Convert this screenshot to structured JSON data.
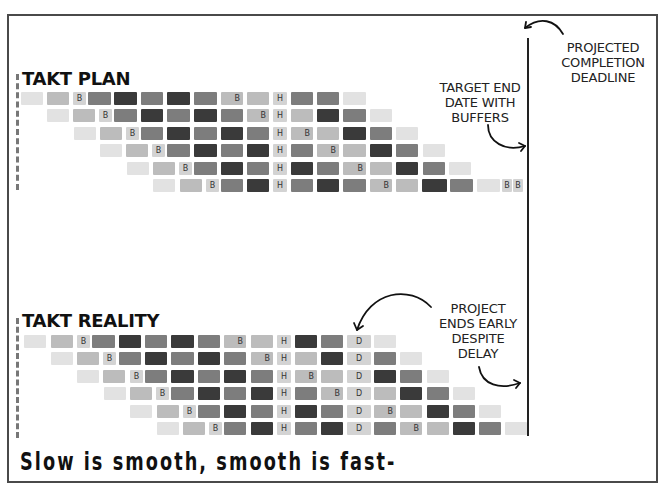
{
  "plan": {
    "title": "TAKT PLAN",
    "row_tops": [
      92,
      109,
      127,
      144,
      162,
      179
    ],
    "rows": [
      [
        [
          21,
          22,
          "L1",
          ""
        ],
        [
          47,
          22,
          "L2",
          ""
        ],
        [
          73,
          13,
          "T",
          "B"
        ],
        [
          88,
          23,
          "M",
          ""
        ],
        [
          114,
          23,
          "D",
          ""
        ],
        [
          141,
          22,
          "M",
          ""
        ],
        [
          167,
          23,
          "D",
          ""
        ],
        [
          194,
          23,
          "M",
          ""
        ],
        [
          221,
          22,
          "L2",
          "B"
        ],
        [
          247,
          22,
          "L2",
          ""
        ],
        [
          273,
          14,
          "T",
          "H"
        ],
        [
          291,
          22,
          "M",
          ""
        ],
        [
          317,
          22,
          "M",
          ""
        ],
        [
          343,
          23,
          "L1",
          ""
        ]
      ],
      [
        [
          47,
          22,
          "L1",
          ""
        ],
        [
          73,
          22,
          "L2",
          ""
        ],
        [
          99,
          13,
          "T",
          "B"
        ],
        [
          114,
          23,
          "M",
          ""
        ],
        [
          141,
          22,
          "D",
          ""
        ],
        [
          167,
          23,
          "M",
          ""
        ],
        [
          194,
          23,
          "D",
          ""
        ],
        [
          221,
          22,
          "M",
          ""
        ],
        [
          247,
          22,
          "L2",
          "B"
        ],
        [
          273,
          14,
          "T",
          "H"
        ],
        [
          291,
          22,
          "L2",
          ""
        ],
        [
          317,
          22,
          "D",
          ""
        ],
        [
          343,
          23,
          "M",
          ""
        ],
        [
          370,
          22,
          "L1",
          ""
        ]
      ],
      [
        [
          74,
          22,
          "L1",
          ""
        ],
        [
          100,
          22,
          "L2",
          ""
        ],
        [
          126,
          13,
          "T",
          "B"
        ],
        [
          141,
          22,
          "M",
          ""
        ],
        [
          167,
          23,
          "D",
          ""
        ],
        [
          194,
          23,
          "M",
          ""
        ],
        [
          221,
          22,
          "D",
          ""
        ],
        [
          247,
          22,
          "M",
          ""
        ],
        [
          273,
          14,
          "T",
          "H"
        ],
        [
          291,
          22,
          "L2",
          "B"
        ],
        [
          317,
          22,
          "L2",
          ""
        ],
        [
          343,
          23,
          "D",
          ""
        ],
        [
          370,
          22,
          "M",
          ""
        ],
        [
          396,
          22,
          "L1",
          ""
        ]
      ],
      [
        [
          100,
          22,
          "L1",
          ""
        ],
        [
          126,
          22,
          "L2",
          ""
        ],
        [
          152,
          13,
          "T",
          "B"
        ],
        [
          167,
          23,
          "M",
          ""
        ],
        [
          194,
          23,
          "D",
          ""
        ],
        [
          221,
          22,
          "M",
          ""
        ],
        [
          247,
          22,
          "D",
          ""
        ],
        [
          273,
          14,
          "T",
          "H"
        ],
        [
          291,
          22,
          "M",
          ""
        ],
        [
          317,
          22,
          "L2",
          "B"
        ],
        [
          343,
          23,
          "L2",
          ""
        ],
        [
          370,
          22,
          "D",
          ""
        ],
        [
          396,
          22,
          "M",
          ""
        ],
        [
          423,
          22,
          "L1",
          ""
        ]
      ],
      [
        [
          127,
          22,
          "L1",
          ""
        ],
        [
          153,
          22,
          "L2",
          ""
        ],
        [
          179,
          13,
          "T",
          "B"
        ],
        [
          194,
          23,
          "M",
          ""
        ],
        [
          221,
          22,
          "D",
          ""
        ],
        [
          247,
          22,
          "M",
          ""
        ],
        [
          273,
          14,
          "T",
          "H"
        ],
        [
          291,
          22,
          "D",
          ""
        ],
        [
          317,
          22,
          "M",
          ""
        ],
        [
          343,
          23,
          "L2",
          "B"
        ],
        [
          370,
          22,
          "L2",
          ""
        ],
        [
          396,
          22,
          "D",
          ""
        ],
        [
          423,
          22,
          "M",
          ""
        ],
        [
          449,
          22,
          "L1",
          ""
        ]
      ],
      [
        [
          153,
          22,
          "L1",
          ""
        ],
        [
          180,
          22,
          "L2",
          ""
        ],
        [
          206,
          13,
          "T",
          "B"
        ],
        [
          221,
          22,
          "M",
          ""
        ],
        [
          247,
          22,
          "D",
          ""
        ],
        [
          273,
          14,
          "T",
          "H"
        ],
        [
          291,
          22,
          "M",
          ""
        ],
        [
          317,
          22,
          "D",
          ""
        ],
        [
          343,
          23,
          "M",
          ""
        ],
        [
          370,
          22,
          "L2",
          "B"
        ],
        [
          396,
          22,
          "L2",
          ""
        ],
        [
          422,
          25,
          "D",
          ""
        ],
        [
          450,
          23,
          "M",
          ""
        ],
        [
          477,
          23,
          "L1",
          ""
        ],
        [
          502,
          10,
          "T",
          "B"
        ],
        [
          513,
          10,
          "T",
          "B"
        ]
      ]
    ]
  },
  "reality": {
    "title": "TAKT REALITY",
    "row_tops": [
      335,
      352,
      370,
      387,
      405,
      422
    ],
    "rows": [
      [
        [
          24,
          22,
          "L1",
          ""
        ],
        [
          51,
          22,
          "L2",
          ""
        ],
        [
          77,
          13,
          "T",
          "B"
        ],
        [
          92,
          23,
          "M",
          ""
        ],
        [
          119,
          22,
          "D",
          ""
        ],
        [
          145,
          22,
          "M",
          ""
        ],
        [
          171,
          23,
          "D",
          ""
        ],
        [
          198,
          22,
          "M",
          ""
        ],
        [
          224,
          22,
          "L2",
          "B"
        ],
        [
          251,
          22,
          "L2",
          ""
        ],
        [
          277,
          14,
          "T",
          "H"
        ],
        [
          295,
          22,
          "D",
          ""
        ],
        [
          321,
          22,
          "M",
          ""
        ],
        [
          347,
          24,
          "T",
          "D"
        ],
        [
          374,
          22,
          "L1",
          ""
        ]
      ],
      [
        [
          51,
          22,
          "L1",
          ""
        ],
        [
          77,
          22,
          "L2",
          ""
        ],
        [
          103,
          13,
          "T",
          "B"
        ],
        [
          119,
          22,
          "M",
          ""
        ],
        [
          145,
          22,
          "D",
          ""
        ],
        [
          171,
          23,
          "M",
          ""
        ],
        [
          198,
          22,
          "D",
          ""
        ],
        [
          224,
          22,
          "M",
          ""
        ],
        [
          251,
          22,
          "L2",
          "B"
        ],
        [
          277,
          14,
          "T",
          "H"
        ],
        [
          295,
          22,
          "L2",
          ""
        ],
        [
          321,
          22,
          "D",
          ""
        ],
        [
          347,
          24,
          "T",
          "D"
        ],
        [
          374,
          22,
          "M",
          ""
        ],
        [
          400,
          22,
          "L1",
          ""
        ]
      ],
      [
        [
          77,
          22,
          "L1",
          ""
        ],
        [
          103,
          22,
          "L2",
          ""
        ],
        [
          130,
          13,
          "T",
          "B"
        ],
        [
          145,
          22,
          "M",
          ""
        ],
        [
          171,
          23,
          "D",
          ""
        ],
        [
          198,
          22,
          "M",
          ""
        ],
        [
          224,
          22,
          "D",
          ""
        ],
        [
          251,
          22,
          "M",
          ""
        ],
        [
          277,
          14,
          "T",
          "H"
        ],
        [
          295,
          22,
          "L2",
          "B"
        ],
        [
          321,
          22,
          "L2",
          ""
        ],
        [
          347,
          24,
          "T",
          "D"
        ],
        [
          374,
          22,
          "D",
          ""
        ],
        [
          400,
          22,
          "M",
          ""
        ],
        [
          427,
          22,
          "L1",
          ""
        ]
      ],
      [
        [
          104,
          22,
          "L1",
          ""
        ],
        [
          130,
          22,
          "L2",
          ""
        ],
        [
          156,
          13,
          "T",
          "B"
        ],
        [
          171,
          23,
          "M",
          ""
        ],
        [
          198,
          22,
          "D",
          ""
        ],
        [
          224,
          22,
          "M",
          ""
        ],
        [
          251,
          22,
          "D",
          ""
        ],
        [
          277,
          14,
          "T",
          "H"
        ],
        [
          295,
          22,
          "M",
          ""
        ],
        [
          321,
          22,
          "L2",
          "B"
        ],
        [
          347,
          24,
          "T",
          "D"
        ],
        [
          374,
          22,
          "L2",
          ""
        ],
        [
          400,
          22,
          "D",
          ""
        ],
        [
          427,
          22,
          "M",
          ""
        ],
        [
          453,
          22,
          "L1",
          ""
        ]
      ],
      [
        [
          130,
          22,
          "L1",
          ""
        ],
        [
          157,
          22,
          "L2",
          ""
        ],
        [
          183,
          13,
          "T",
          "B"
        ],
        [
          198,
          22,
          "M",
          ""
        ],
        [
          224,
          22,
          "D",
          ""
        ],
        [
          251,
          22,
          "M",
          ""
        ],
        [
          277,
          14,
          "T",
          "H"
        ],
        [
          295,
          22,
          "D",
          ""
        ],
        [
          321,
          22,
          "M",
          ""
        ],
        [
          347,
          24,
          "T",
          "D"
        ],
        [
          374,
          22,
          "L2",
          "B"
        ],
        [
          400,
          22,
          "L2",
          ""
        ],
        [
          427,
          22,
          "D",
          ""
        ],
        [
          453,
          22,
          "M",
          ""
        ],
        [
          479,
          22,
          "L1",
          ""
        ]
      ],
      [
        [
          157,
          22,
          "L1",
          ""
        ],
        [
          183,
          22,
          "L2",
          ""
        ],
        [
          209,
          13,
          "T",
          "B"
        ],
        [
          224,
          22,
          "M",
          ""
        ],
        [
          251,
          22,
          "D",
          ""
        ],
        [
          277,
          14,
          "T",
          "H"
        ],
        [
          295,
          22,
          "M",
          ""
        ],
        [
          321,
          22,
          "D",
          ""
        ],
        [
          347,
          24,
          "T",
          "D"
        ],
        [
          374,
          22,
          "M",
          ""
        ],
        [
          400,
          22,
          "L2",
          "B"
        ],
        [
          427,
          22,
          "L2",
          ""
        ],
        [
          453,
          22,
          "D",
          ""
        ],
        [
          479,
          22,
          "M",
          ""
        ],
        [
          505,
          22,
          "L1",
          ""
        ]
      ]
    ]
  },
  "shades": {
    "L1": "#e2e2e2",
    "L2": "#bcbcbc",
    "T": "#d3d3d3",
    "M": "#7d7d7d",
    "D": "#3a3a3a"
  },
  "annotations": {
    "projected_deadline": [
      "PROJECTED",
      "COMPLETION",
      "DEADLINE"
    ],
    "target_end": [
      "TARGET END",
      "DATE WITH",
      "BUFFERS"
    ],
    "ends_early": [
      "PROJECT",
      "ENDS EARLY",
      "DESPITE",
      "DELAY"
    ]
  },
  "legend_labels": {
    "buffer": "B",
    "holiday": "H",
    "delay": "D"
  },
  "tagline": "Slow is smooth, smooth is fast-"
}
